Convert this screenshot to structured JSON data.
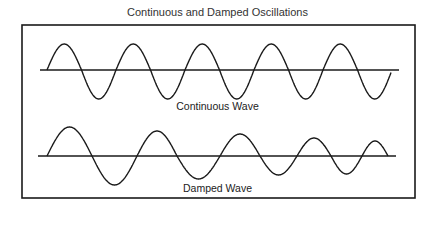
{
  "title": "Continuous and Damped Oscillations",
  "labels": {
    "continuous": "Continuous Wave",
    "damped": "Damped Wave"
  },
  "colors": {
    "stroke": "#1a1a1a",
    "background": "#ffffff"
  },
  "diagram": {
    "frame": {
      "x": 22,
      "y": 25,
      "width": 393,
      "height": 173
    },
    "continuous_wave": {
      "baseline_y": 70,
      "axis_x": [
        40,
        399
      ],
      "start_x": 47,
      "end_x": 391,
      "amplitude_up": 26,
      "amplitude_down": 29,
      "period": 69,
      "peaks_x": [
        62,
        132,
        202,
        272,
        342
      ],
      "cycles": 5
    },
    "damped_wave": {
      "baseline_y": 156,
      "axis_x": [
        38,
        396
      ],
      "start_x": 47,
      "end_x": 388,
      "extrema": [
        {
          "x": 70,
          "y": 127
        },
        {
          "x": 115,
          "y": 185
        },
        {
          "x": 155,
          "y": 131
        },
        {
          "x": 198,
          "y": 179
        },
        {
          "x": 240,
          "y": 134
        },
        {
          "x": 280,
          "y": 175
        },
        {
          "x": 314,
          "y": 138
        },
        {
          "x": 348,
          "y": 174
        },
        {
          "x": 373,
          "y": 141
        }
      ],
      "crossings_x": [
        47,
        92,
        137,
        177,
        220,
        260,
        297,
        331,
        362,
        388
      ]
    }
  }
}
